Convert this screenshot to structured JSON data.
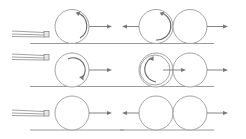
{
  "diagram": {
    "title": "",
    "rows": [
      {
        "id": "topspin",
        "cue_ball_spin": "counterclockwise-arc-top",
        "cue_ball_motion": "right",
        "collision_left_ball_spin": "counterclockwise-arc",
        "collision_left_ball_motion": "left",
        "collision_right_ball_motion": "right"
      },
      {
        "id": "backspin",
        "cue_ball_spin": "clockwise-arc",
        "cue_ball_motion": "right",
        "collision_left_ball_spin": "counterclockwise-arc",
        "collision_left_ball_motion": "right",
        "collision_right_ball_motion": "right"
      },
      {
        "id": "no-spin",
        "cue_ball_spin": "none",
        "cue_ball_motion": "right",
        "collision_left_ball_spin": "none",
        "collision_left_ball_motion": "left",
        "collision_right_ball_motion": "right"
      }
    ],
    "colors": {
      "line": "#9a9a9a",
      "arrow": "#777777",
      "background": "#ffffff"
    }
  }
}
